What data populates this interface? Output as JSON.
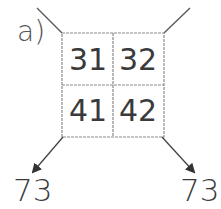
{
  "label": "a)",
  "grid": {
    "cells": [
      {
        "value": "31"
      },
      {
        "value": "32"
      },
      {
        "value": "41"
      },
      {
        "value": "42"
      }
    ]
  },
  "results": {
    "left": "73",
    "right": "73"
  },
  "colors": {
    "line": "#7a7a7a",
    "arrow": "#333333",
    "text": "#3a3a3a"
  }
}
